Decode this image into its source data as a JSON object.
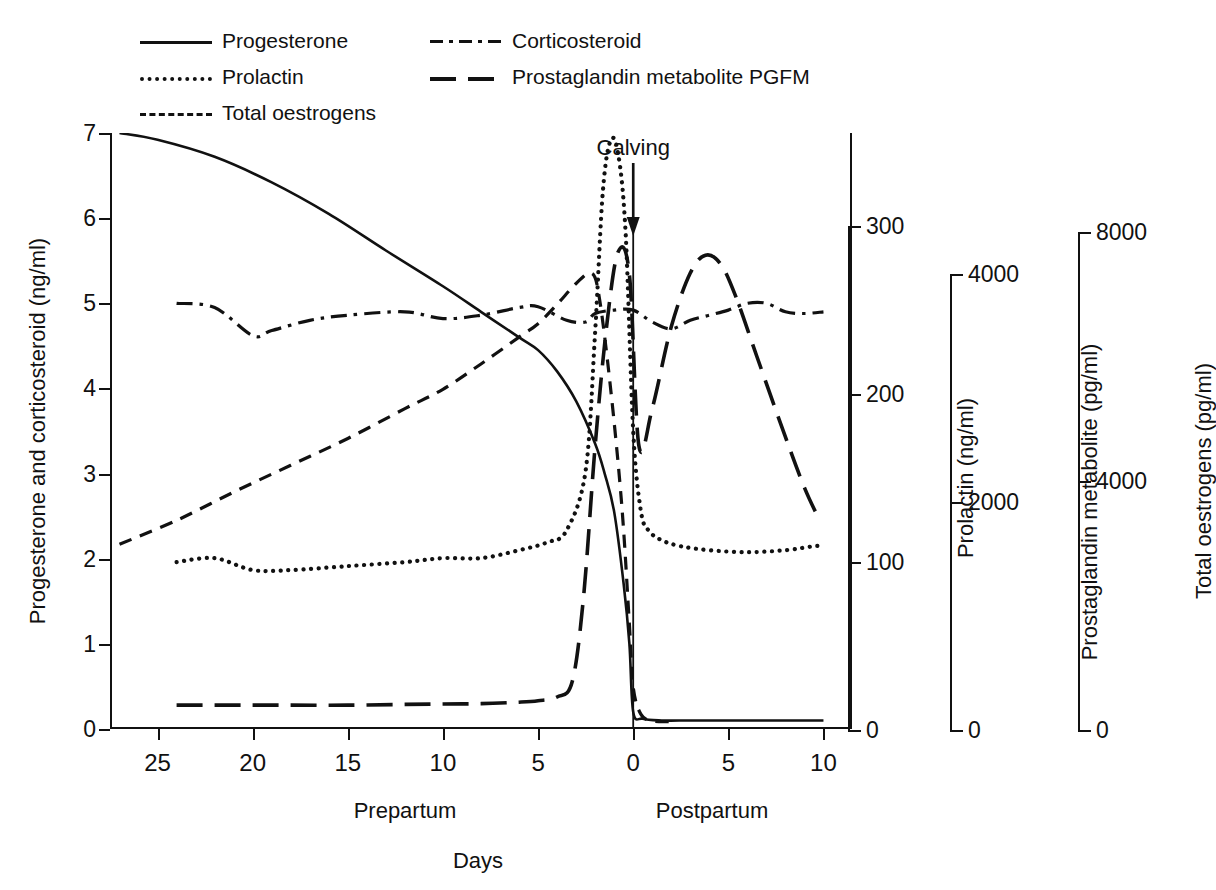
{
  "legend": {
    "items": [
      {
        "label": "Progesterone",
        "style": "solid",
        "col": 1,
        "row": 1
      },
      {
        "label": "Prolactin",
        "style": "dotted",
        "col": 1,
        "row": 2
      },
      {
        "label": "Total oestrogens",
        "style": "dashed",
        "col": 1,
        "row": 3
      },
      {
        "label": "Corticosteroid",
        "style": "dashdot",
        "col": 2,
        "row": 1
      },
      {
        "label": "Prostaglandin metabolite PGFM",
        "style": "longdash",
        "col": 2,
        "row": 2
      }
    ]
  },
  "annotation": {
    "calving": "Calving"
  },
  "captions": {
    "prepartum": "Prepartum",
    "postpartum": "Postpartum",
    "xaxis": "Days"
  },
  "axes": {
    "left": {
      "title": "Progesterone and corticosteroid (ng/ml)",
      "ticks": [
        "0",
        "1",
        "2",
        "3",
        "4",
        "5",
        "6",
        "7"
      ],
      "min": 0,
      "max": 7
    },
    "x": {
      "ticks": [
        "25",
        "20",
        "15",
        "10",
        "5",
        "0",
        "5",
        "10"
      ],
      "values": [
        -25,
        -20,
        -15,
        -10,
        -5,
        0,
        5,
        10
      ],
      "min": -27.5,
      "max": 11.5
    },
    "prolactin": {
      "title": "Prolactin (ng/ml)",
      "ticks": [
        "0",
        "100",
        "200",
        "300"
      ],
      "min": 0,
      "max": 300
    },
    "pgfm": {
      "title": "Prostaglandin metabolite (pg/ml)",
      "ticks": [
        "0",
        "2000",
        "4000"
      ],
      "min": 0,
      "max": 4000
    },
    "oestrogens": {
      "title": "Total oestrogens (pg/ml)",
      "ticks": [
        "0",
        "4000",
        "8000"
      ],
      "min": 0,
      "max": 8000
    }
  },
  "colors": {
    "ink": "#111111",
    "background": "#ffffff"
  },
  "chart_data": {
    "type": "line",
    "title": "",
    "subtitle": "",
    "xlabel": "Days",
    "grid": false,
    "legend_position": "top-left",
    "x_unit": "days relative to calving (negative = prepartum)",
    "event_marker": {
      "label": "Calving",
      "x": 0
    },
    "axes_note": "Four independent vertical scales; all series digitised here in their own units.",
    "series": [
      {
        "name": "Progesterone",
        "style": "solid",
        "axis": "left",
        "unit": "ng/ml",
        "ylim": [
          0,
          7
        ],
        "x": [
          -27.0,
          -25.0,
          -22.0,
          -19.0,
          -16.0,
          -13.0,
          -10.0,
          -8.0,
          -6.0,
          -5.0,
          -4.0,
          -3.0,
          -2.0,
          -1.5,
          -1.0,
          -0.5,
          -0.2,
          0.0,
          0.5,
          1.5,
          3.0,
          5.0,
          7.0,
          9.0,
          10.0
        ],
        "y": [
          7.0,
          6.92,
          6.72,
          6.42,
          6.05,
          5.62,
          5.2,
          4.9,
          4.6,
          4.45,
          4.2,
          3.85,
          3.35,
          3.0,
          2.55,
          1.7,
          1.0,
          0.2,
          0.12,
          0.1,
          0.1,
          0.1,
          0.1,
          0.1,
          0.1
        ]
      },
      {
        "name": "Corticosteroid",
        "style": "dashdot",
        "axis": "left",
        "unit": "ng/ml",
        "ylim": [
          0,
          7
        ],
        "x": [
          -24.0,
          -22.0,
          -20.0,
          -19.0,
          -17.0,
          -15.0,
          -12.0,
          -10.0,
          -8.0,
          -6.0,
          -5.0,
          -3.5,
          -2.5,
          -2.0,
          -1.0,
          0.0,
          1.0,
          2.0,
          3.0,
          4.0,
          5.0,
          6.0,
          7.0,
          8.0,
          9.0,
          10.0
        ],
        "y": [
          5.0,
          4.95,
          4.62,
          4.68,
          4.8,
          4.86,
          4.9,
          4.82,
          4.86,
          4.95,
          4.96,
          4.8,
          4.78,
          4.88,
          4.92,
          4.92,
          4.78,
          4.7,
          4.8,
          4.86,
          4.92,
          5.0,
          5.0,
          4.9,
          4.88,
          4.9
        ]
      },
      {
        "name": "Prolactin",
        "style": "dotted",
        "axis": "prolactin",
        "unit": "ng/ml",
        "ylim": [
          0,
          300
        ],
        "x": [
          -24.0,
          -22.0,
          -20.0,
          -18.0,
          -15.0,
          -12.0,
          -10.0,
          -8.0,
          -6.0,
          -4.5,
          -3.5,
          -2.5,
          -2.0,
          -1.6,
          -1.2,
          -0.8,
          -0.4,
          0.0,
          0.4,
          0.8,
          1.5,
          2.5,
          4.0,
          6.0,
          8.0,
          9.5,
          10.0
        ],
        "y": [
          84,
          86,
          80,
          80,
          82,
          84,
          86,
          86,
          90,
          94,
          100,
          130,
          200,
          270,
          296,
          290,
          250,
          150,
          110,
          100,
          95,
          92,
          90,
          89,
          90,
          92,
          92
        ]
      },
      {
        "name": "Total oestrogens",
        "style": "dashed",
        "axis": "oestrogens",
        "unit": "pg/ml",
        "ylim": [
          0,
          8000
        ],
        "x": [
          -27.0,
          -24.0,
          -21.0,
          -18.0,
          -15.0,
          -12.0,
          -10.0,
          -8.0,
          -6.0,
          -5.0,
          -4.0,
          -3.0,
          -2.2,
          -1.8,
          -1.2,
          -0.6,
          -0.2,
          0.0,
          0.4,
          1.0,
          2.0
        ],
        "y": [
          2480,
          2800,
          3180,
          3540,
          3900,
          4300,
          4560,
          4900,
          5260,
          5440,
          5700,
          5980,
          6120,
          5820,
          4600,
          3000,
          1400,
          560,
          200,
          110,
          100
        ]
      },
      {
        "name": "Prostaglandin metabolite PGFM",
        "style": "longdash",
        "axis": "pgfm",
        "unit": "pg/ml",
        "ylim": [
          0,
          4000
        ],
        "x": [
          -24.0,
          -21.0,
          -18.0,
          -15.0,
          -12.0,
          -10.0,
          -8.0,
          -6.0,
          -5.0,
          -4.0,
          -3.2,
          -2.6,
          -2.0,
          -1.4,
          -0.8,
          -0.2,
          0.3,
          1.0,
          2.0,
          3.0,
          3.8,
          4.6,
          5.4,
          6.5,
          8.0,
          9.0,
          9.8
        ],
        "y": [
          160,
          160,
          160,
          160,
          165,
          168,
          170,
          180,
          190,
          215,
          320,
          900,
          1900,
          2700,
          3200,
          3050,
          1900,
          2150,
          2700,
          3060,
          3180,
          3120,
          2900,
          2500,
          1960,
          1620,
          1400
        ]
      }
    ]
  }
}
